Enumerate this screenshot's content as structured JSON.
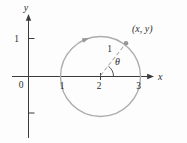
{
  "colors": {
    "axis": "#3b3b3b",
    "circle": "#adadad",
    "marker": "#979797",
    "text": "#2e2e2e"
  },
  "figure": {
    "axis_labels": {
      "x": "x",
      "y": "y"
    },
    "origin_label": "0",
    "y_axis_tick_label": "1",
    "x_axis_tick_labels": [
      "1",
      "2",
      "3"
    ],
    "radius_label": "1",
    "angle_label": "θ",
    "point_label": "(x, y)"
  },
  "geometry": {
    "circle_center": [
      2,
      0
    ],
    "circle_radius": 1,
    "point_angle_deg": 52,
    "motion_direction": "clockwise"
  }
}
